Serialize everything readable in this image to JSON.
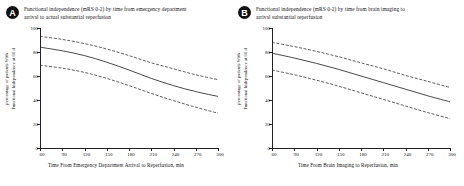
{
  "figure": {
    "panels": [
      {
        "badge": "A",
        "title_line1": "Functional independence (mRS 0-2) by time from emergency department",
        "title_line2": "arrival to actual substantial reperfusion",
        "ylabel_line1": "percentage of patients With",
        "ylabel_line2": "Functional Independence at 90 d",
        "xlabel": "Time From Emergency Department Arrival to Reperfusion,  min"
      },
      {
        "badge": "B",
        "title_line1": "Functional independence (mRS 0-2) by time from brain imaging to",
        "title_line2": "arrival substantial reperfusion",
        "ylabel_line1": "percentage of patients With",
        "ylabel_line2": "Functional Independence at 90 d",
        "xlabel": "Time From Brain Imaging to Reperfusion,  min"
      }
    ]
  },
  "chart_data": [
    {
      "type": "line",
      "panel": "A",
      "title": "Functional independence (mRS 0-2) by time from emergency department arrival to actual substantial reperfusion",
      "xlabel": "Time From Emergency Department Arrival to Reperfusion, min",
      "ylabel": "percentage of patients With Functional Independence at 90 d",
      "xlim": [
        60,
        300
      ],
      "ylim": [
        0,
        100
      ],
      "xticks": [
        60,
        90,
        120,
        150,
        180,
        210,
        240,
        270,
        300
      ],
      "yticks": [
        0,
        20,
        40,
        60,
        80,
        100
      ],
      "grid": false,
      "legend": "none",
      "x": [
        60,
        90,
        120,
        150,
        180,
        210,
        240,
        270,
        300
      ],
      "series": [
        {
          "name": "Upper 95% CI",
          "style": "dashed",
          "values": [
            93.0,
            90.5,
            87.0,
            82.5,
            77.0,
            71.0,
            66.0,
            61.0,
            57.0
          ]
        },
        {
          "name": "Predicted probability",
          "style": "solid",
          "values": [
            84.0,
            81.0,
            77.0,
            71.5,
            65.0,
            58.0,
            52.0,
            47.0,
            43.0
          ]
        },
        {
          "name": "Lower 95% CI",
          "style": "dashed",
          "values": [
            69.0,
            66.5,
            63.0,
            58.0,
            52.0,
            45.5,
            39.5,
            34.0,
            29.0
          ]
        }
      ]
    },
    {
      "type": "line",
      "panel": "B",
      "title": "Functional independence (mRS 0-2) by time from brain imaging to arrival substantial reperfusion",
      "xlabel": "Time From Brain Imaging to Reperfusion, min",
      "ylabel": "percentage of patients With Functional Independence at 90 d",
      "xlim": [
        60,
        300
      ],
      "ylim": [
        0,
        100
      ],
      "xticks": [
        60,
        90,
        120,
        150,
        180,
        210,
        240,
        270,
        300
      ],
      "yticks": [
        0,
        20,
        40,
        60,
        80,
        100
      ],
      "grid": false,
      "legend": "none",
      "x": [
        60,
        90,
        120,
        150,
        180,
        210,
        240,
        270,
        300
      ],
      "series": [
        {
          "name": "Upper 95% CI",
          "style": "dashed",
          "values": [
            88.0,
            84.5,
            80.5,
            76.0,
            71.0,
            66.0,
            60.5,
            55.5,
            50.5
          ]
        },
        {
          "name": "Predicted probability",
          "style": "solid",
          "values": [
            79.0,
            75.0,
            70.5,
            65.5,
            60.0,
            54.5,
            49.0,
            43.5,
            38.5
          ]
        },
        {
          "name": "Lower 95% CI",
          "style": "dashed",
          "values": [
            65.0,
            61.0,
            56.5,
            51.5,
            46.0,
            40.5,
            35.0,
            29.5,
            24.5
          ]
        }
      ]
    }
  ]
}
